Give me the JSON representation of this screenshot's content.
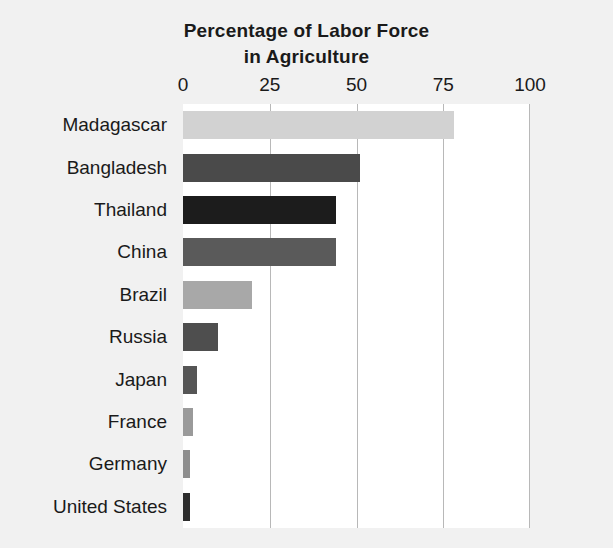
{
  "chart_data": {
    "type": "bar",
    "orientation": "horizontal",
    "title": "Percentage of Labor Force in Agriculture",
    "title_lines": [
      "Percentage of Labor Force",
      "in Agriculture"
    ],
    "xlabel": "",
    "ylabel": "",
    "xlim": [
      0,
      100
    ],
    "xticks": [
      0,
      25,
      50,
      75,
      100
    ],
    "xtick_labels": [
      "0",
      "25",
      "50",
      "75",
      "100"
    ],
    "grid": "vertical",
    "legend": "none",
    "axis_position": "top",
    "plot_background": "#ffffff",
    "figure_background": "#f1f1f1",
    "gridline_color": "#b8b8b8",
    "categories": [
      "Madagascar",
      "Bangladesh",
      "Thailand",
      "China",
      "Brazil",
      "Russia",
      "Japan",
      "France",
      "Germany",
      "United States"
    ],
    "values": [
      78,
      51,
      44,
      44,
      20,
      10,
      4,
      3,
      2,
      2
    ],
    "bar_colors": [
      "#d2d2d2",
      "#4a4a4a",
      "#1c1c1c",
      "#5a5a5a",
      "#a8a8a8",
      "#4e4e4e",
      "#555555",
      "#9a9a9a",
      "#8e8e8e",
      "#2e2e2e"
    ],
    "bars": [
      {
        "label": "Madagascar",
        "value": 78,
        "color": "#d2d2d2"
      },
      {
        "label": "Bangladesh",
        "value": 51,
        "color": "#4a4a4a"
      },
      {
        "label": "Thailand",
        "value": 44,
        "color": "#1c1c1c"
      },
      {
        "label": "China",
        "value": 44,
        "color": "#5a5a5a"
      },
      {
        "label": "Brazil",
        "value": 20,
        "color": "#a8a8a8"
      },
      {
        "label": "Russia",
        "value": 10,
        "color": "#4e4e4e"
      },
      {
        "label": "Japan",
        "value": 4,
        "color": "#555555"
      },
      {
        "label": "France",
        "value": 3,
        "color": "#9a9a9a"
      },
      {
        "label": "Germany",
        "value": 2,
        "color": "#8e8e8e"
      },
      {
        "label": "United States",
        "value": 2,
        "color": "#2e2e2e"
      }
    ]
  }
}
